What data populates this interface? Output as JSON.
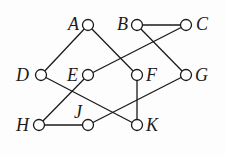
{
  "graph": {
    "nodes": [
      {
        "id": "A",
        "label": "A",
        "x": 88,
        "y": 25,
        "label_side": "left"
      },
      {
        "id": "B",
        "label": "B",
        "x": 137,
        "y": 25,
        "label_side": "left"
      },
      {
        "id": "C",
        "label": "C",
        "x": 186,
        "y": 25,
        "label_side": "right"
      },
      {
        "id": "D",
        "label": "D",
        "x": 41,
        "y": 75,
        "label_side": "left"
      },
      {
        "id": "E",
        "label": "E",
        "x": 88,
        "y": 75,
        "label_side": "left"
      },
      {
        "id": "F",
        "label": "F",
        "x": 137,
        "y": 75,
        "label_side": "right"
      },
      {
        "id": "G",
        "label": "G",
        "x": 186,
        "y": 75,
        "label_side": "right"
      },
      {
        "id": "H",
        "label": "H",
        "x": 39,
        "y": 125,
        "label_side": "left"
      },
      {
        "id": "J",
        "label": "J",
        "x": 88,
        "y": 125,
        "label_side": "top-left"
      },
      {
        "id": "K",
        "label": "K",
        "x": 137,
        "y": 125,
        "label_side": "right"
      }
    ],
    "edges": [
      [
        "A",
        "D"
      ],
      [
        "A",
        "F"
      ],
      [
        "B",
        "C"
      ],
      [
        "B",
        "G"
      ],
      [
        "C",
        "E"
      ],
      [
        "D",
        "K"
      ],
      [
        "E",
        "H"
      ],
      [
        "F",
        "K"
      ],
      [
        "G",
        "J"
      ],
      [
        "H",
        "J"
      ]
    ],
    "colors": {
      "stroke": "#1a1a1a",
      "node_fill": "#ffffff"
    }
  }
}
